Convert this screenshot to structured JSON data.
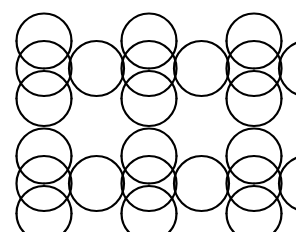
{
  "figure": {
    "kind": "geometric-line-art"
  },
  "canvas": {
    "width": 296,
    "height": 232,
    "background_color": "#ffffff"
  },
  "style": {
    "stroke_color": "#000000",
    "stroke_width": 2.2,
    "fill": "none",
    "linecap": "round",
    "linejoin": "round"
  },
  "geometry": {
    "lobe_radius": 27.5,
    "cell_width": 52.5,
    "cell_height": 57.5,
    "grid_origin_x": 16.5,
    "grid_origin_y": 0,
    "columns": 6,
    "rows": 5,
    "horizontal_period": 105,
    "vertical_period": 115,
    "description": "Circular lobes of equal radius placed on a staggered rectangular lattice; alternating lobes bulge outward and inward to create fan shapes and concave notches."
  },
  "chart_data": {
    "type": "scatter",
    "xlabel": "",
    "ylabel": "",
    "xlim": [
      0,
      296
    ],
    "ylim": [
      0,
      232
    ],
    "grid": false,
    "legend": "none",
    "lobes": [
      {
        "cx": 44,
        "cy": 41,
        "r": 28,
        "start": 180,
        "end": 360,
        "bulge": "up"
      },
      {
        "cx": 44,
        "cy": 41,
        "r": 28,
        "start": 180,
        "end": 270,
        "bulge": "notch-left"
      },
      {
        "cx": 96,
        "cy": 41,
        "r": 28,
        "start": 180,
        "end": 360,
        "bulge": "up"
      },
      {
        "cx": 148,
        "cy": 41,
        "r": 28,
        "start": 180,
        "end": 360,
        "bulge": "up"
      },
      {
        "cx": 200,
        "cy": 41,
        "r": 28,
        "start": 180,
        "end": 360,
        "bulge": "up"
      },
      {
        "cx": 252,
        "cy": 41,
        "r": 28,
        "start": 180,
        "end": 360,
        "bulge": "up"
      },
      {
        "cx": 44,
        "cy": 98,
        "r": 28,
        "start": 0,
        "end": 180,
        "bulge": "down"
      },
      {
        "cx": 96,
        "cy": 98,
        "r": 28,
        "start": 0,
        "end": 180,
        "bulge": "down"
      },
      {
        "cx": 148,
        "cy": 98,
        "r": 28,
        "start": 0,
        "end": 180,
        "bulge": "down"
      },
      {
        "cx": 200,
        "cy": 98,
        "r": 28,
        "start": 0,
        "end": 180,
        "bulge": "down"
      },
      {
        "cx": 252,
        "cy": 98,
        "r": 28,
        "start": 0,
        "end": 180,
        "bulge": "down"
      }
    ],
    "crossing_points_x": [
      42,
      94,
      145,
      198,
      250
    ],
    "crossing_points_y": [
      57,
      115,
      172,
      228
    ],
    "values": [],
    "categories": []
  },
  "paths": {
    "row_offsets_y": [
      0,
      115
    ],
    "col_offsets_x": [
      0,
      105,
      210
    ],
    "tile": {
      "big_fan_top": "M 17 33 A 28 28 0 0 1 72 33",
      "note": "Tile is replicated across a 3-column by 2-row lattice with 105px horizontal and 115px vertical period."
    }
  }
}
